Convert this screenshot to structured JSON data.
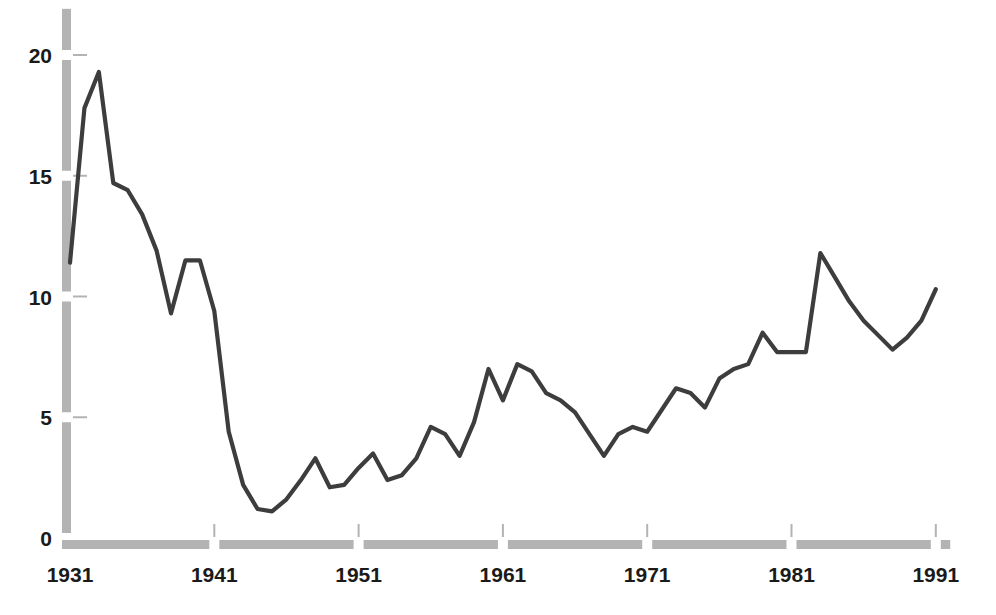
{
  "chart_data": {
    "type": "line",
    "title": "",
    "subtitle": "",
    "xlabel": "",
    "ylabel": "",
    "xlim": [
      1931,
      1992
    ],
    "ylim": [
      0,
      21
    ],
    "grid": false,
    "legend": "none",
    "line_color": "#3d3d3d",
    "axis_color": "#b3b3b3",
    "x_tick_labels": [
      "1931",
      "1941",
      "1951",
      "1961",
      "1971",
      "1981",
      "1991"
    ],
    "x_ticks": [
      1931,
      1941,
      1951,
      1961,
      1971,
      1981,
      1991
    ],
    "y_tick_labels": [
      "0",
      "5",
      "10",
      "15",
      "20"
    ],
    "y_ticks": [
      0,
      5,
      10,
      15,
      20
    ],
    "x": [
      1931,
      1932,
      1933,
      1934,
      1935,
      1936,
      1937,
      1938,
      1939,
      1940,
      1941,
      1942,
      1943,
      1944,
      1945,
      1946,
      1947,
      1948,
      1949,
      1950,
      1951,
      1952,
      1953,
      1954,
      1955,
      1956,
      1957,
      1958,
      1959,
      1960,
      1961,
      1962,
      1963,
      1964,
      1965,
      1966,
      1967,
      1968,
      1969,
      1970,
      1971,
      1972,
      1973,
      1974,
      1975,
      1976,
      1977,
      1978,
      1979,
      1980,
      1981,
      1982,
      1983,
      1984,
      1985,
      1986,
      1987,
      1988,
      1989,
      1990,
      1991
    ],
    "values": [
      11.4,
      17.8,
      19.3,
      14.7,
      14.4,
      13.4,
      11.9,
      9.3,
      11.5,
      11.5,
      9.4,
      4.4,
      2.2,
      1.2,
      1.1,
      1.6,
      2.4,
      3.3,
      2.1,
      2.2,
      2.9,
      3.5,
      2.4,
      2.6,
      3.3,
      4.6,
      4.3,
      3.4,
      4.8,
      7.0,
      5.7,
      7.2,
      6.9,
      6.0,
      5.7,
      5.2,
      4.3,
      3.4,
      4.3,
      4.6,
      4.4,
      5.3,
      6.2,
      6.0,
      5.4,
      6.6,
      7.0,
      7.2,
      8.5,
      7.7,
      7.7,
      7.7,
      11.8,
      10.8,
      9.8,
      9.0,
      8.4,
      7.8,
      8.3,
      9.0,
      10.3
    ],
    "series": [
      {
        "name": "series-1",
        "color": "#3d3d3d",
        "values": [
          11.4,
          17.8,
          19.3,
          14.7,
          14.4,
          13.4,
          11.9,
          9.3,
          11.5,
          11.5,
          9.4,
          4.4,
          2.2,
          1.2,
          1.1,
          1.6,
          2.4,
          3.3,
          2.1,
          2.2,
          2.9,
          3.5,
          2.4,
          2.6,
          3.3,
          4.6,
          4.3,
          3.4,
          4.8,
          7.0,
          5.7,
          7.2,
          6.9,
          6.0,
          5.7,
          5.2,
          4.3,
          3.4,
          4.3,
          4.6,
          4.4,
          5.3,
          6.2,
          6.0,
          5.4,
          6.6,
          7.0,
          7.2,
          8.5,
          7.7,
          7.7,
          7.7,
          11.8,
          10.8,
          9.8,
          9.0,
          8.4,
          7.8,
          8.3,
          9.0,
          10.3
        ]
      }
    ],
    "annotations": []
  }
}
